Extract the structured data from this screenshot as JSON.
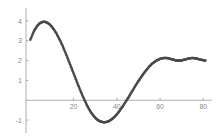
{
  "chart_data": {
    "type": "scatter",
    "title": "",
    "subtitle": "",
    "xlabel": "",
    "ylabel": "",
    "xlim": [
      -2,
      84
    ],
    "ylim": [
      -1.45,
      4.35
    ],
    "grid": false,
    "legend": null,
    "marker": "dot",
    "marker_color": "#4a4a4a",
    "marker_size": 1.25,
    "xticks": [
      20,
      40,
      60,
      80
    ],
    "xtick_labels": [
      "20",
      "40",
      "60",
      "80"
    ],
    "yticks": [
      -1,
      1,
      2,
      3,
      4
    ],
    "ytick_labels": [
      "-1",
      "1",
      "2",
      "3",
      "4"
    ],
    "annotations": [],
    "x": [
      0,
      1,
      2,
      3,
      4,
      5,
      6,
      7,
      8,
      9,
      10,
      11,
      12,
      13,
      14,
      15,
      16,
      17,
      18,
      19,
      20,
      21,
      22,
      23,
      24,
      25,
      26,
      27,
      28,
      29,
      30,
      31,
      32,
      33,
      34,
      35,
      36,
      37,
      38,
      39,
      40,
      41,
      42,
      43,
      44,
      45,
      46,
      47,
      48,
      49,
      50,
      51,
      52,
      53,
      54,
      55,
      56,
      57,
      58,
      59,
      60,
      61,
      62,
      63,
      64,
      65,
      66,
      67,
      68,
      69,
      70,
      71,
      72,
      73,
      74,
      75,
      76,
      77,
      78,
      79,
      80,
      81
    ],
    "y": [
      3.05,
      3.32,
      3.55,
      3.72,
      3.85,
      3.92,
      3.96,
      3.95,
      3.9,
      3.82,
      3.7,
      3.55,
      3.38,
      3.18,
      2.96,
      2.72,
      2.46,
      2.2,
      1.92,
      1.64,
      1.36,
      1.08,
      0.8,
      0.53,
      0.27,
      0.02,
      -0.21,
      -0.42,
      -0.6,
      -0.75,
      -0.88,
      -0.98,
      -1.05,
      -1.09,
      -1.11,
      -1.1,
      -1.07,
      -1.01,
      -0.93,
      -0.83,
      -0.71,
      -0.57,
      -0.42,
      -0.26,
      -0.09,
      0.08,
      0.26,
      0.44,
      0.62,
      0.8,
      0.97,
      1.13,
      1.29,
      1.44,
      1.57,
      1.7,
      1.81,
      1.9,
      1.98,
      2.04,
      2.09,
      2.12,
      2.13,
      2.13,
      2.11,
      2.08,
      2.05,
      2.02,
      2.0,
      2.0,
      2.01,
      2.04,
      2.07,
      2.1,
      2.12,
      2.13,
      2.12,
      2.1,
      2.07,
      2.04,
      2.02,
      2.0
    ],
    "axis_color": "#9a9a9a",
    "label_color": "#8a8a8a",
    "background": "#ffffff"
  }
}
